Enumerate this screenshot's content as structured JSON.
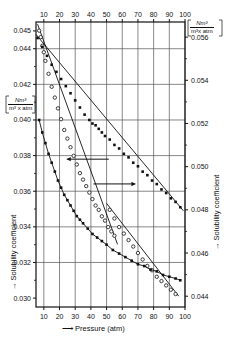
{
  "figure": {
    "background": "#ffffff",
    "axis_color": "#111111",
    "grid_color": "#555555"
  },
  "axes": {
    "bottom": {
      "label": "Pressure (atm)",
      "arrow": "⟶",
      "ticks": [
        "10",
        "20",
        "30",
        "40",
        "50",
        "60",
        "70",
        "80",
        "90",
        "100"
      ],
      "values": [
        10,
        20,
        30,
        40,
        50,
        60,
        70,
        80,
        90,
        100
      ],
      "range": [
        5,
        100
      ]
    },
    "top": {
      "ticks": [
        "10",
        "20",
        "30",
        "40",
        "50",
        "60",
        "70",
        "80",
        "90",
        "100"
      ],
      "values": [
        10,
        20,
        30,
        40,
        50,
        60,
        70,
        80,
        90,
        100
      ],
      "range": [
        5,
        100
      ]
    },
    "left": {
      "title": "Solubility coefficient",
      "arrow": "↑",
      "unit_numerator": "Nm³",
      "unit_denominator": "m³ x atm",
      "ticks": [
        "0.045",
        "0.044",
        "0.042",
        "0.040",
        "0.038",
        "0.036",
        "0.034",
        "0.032",
        "0.030"
      ],
      "values": [
        0.045,
        0.044,
        0.042,
        0.04,
        0.038,
        0.036,
        0.034,
        0.032,
        0.03
      ],
      "range": [
        0.0295,
        0.0455
      ]
    },
    "right": {
      "title": "Solubility coefficient",
      "arrow": "↑",
      "unit_numerator": "Nm³",
      "unit_denominator": "m³x atm",
      "ticks": [
        "0.056",
        "0.054",
        "0.052",
        "0.050",
        "0.048",
        "0.046",
        "0.044"
      ],
      "values": [
        0.056,
        0.054,
        0.052,
        0.05,
        0.048,
        0.046,
        0.044
      ],
      "range": [
        0.0435,
        0.0567
      ]
    }
  },
  "annotations": [
    {
      "name": "arrow-to-right-axis",
      "direction": "right",
      "x_data": 55,
      "y_right": 0.0492
    },
    {
      "name": "arrow-to-left-axis",
      "direction": "left",
      "x_data": 38,
      "y_left": 0.0378
    }
  ],
  "chart_data": {
    "type": "scatter",
    "title": "",
    "xlabel": "Pressure (atm)",
    "ylabel": "Solubility coefficient",
    "xlim": [
      5,
      100
    ],
    "grid": true,
    "legend": "none",
    "series": [
      {
        "name": "upper-curve",
        "axis": "right",
        "marker": "open-circle",
        "ylim": [
          0.0435,
          0.0567
        ],
        "points": [
          [
            7,
            0.0563
          ],
          [
            8,
            0.056
          ],
          [
            9,
            0.0556
          ],
          [
            10,
            0.0553
          ],
          [
            11,
            0.0549
          ],
          [
            13,
            0.0543
          ],
          [
            15,
            0.0537
          ],
          [
            17,
            0.0532
          ],
          [
            19,
            0.0527
          ],
          [
            21,
            0.0522
          ],
          [
            23,
            0.0517
          ],
          [
            25,
            0.0513
          ],
          [
            27,
            0.0509
          ],
          [
            29,
            0.0505
          ],
          [
            31,
            0.0501
          ],
          [
            33,
            0.0497
          ],
          [
            35,
            0.0494
          ],
          [
            37,
            0.0491
          ],
          [
            39,
            0.0488
          ],
          [
            41,
            0.0485
          ],
          [
            43,
            0.0482
          ],
          [
            45,
            0.048
          ],
          [
            47,
            0.0477
          ],
          [
            49,
            0.0475
          ],
          [
            51,
            0.0472
          ],
          [
            53,
            0.047
          ],
          [
            55,
            0.0468
          ]
        ],
        "fit_line": [
          [
            6,
            0.0566
          ],
          [
            57,
            0.0464
          ]
        ]
      },
      {
        "name": "middle-curve",
        "axis": "right",
        "marker": "open-circle",
        "ylim": [
          0.0435,
          0.0567
        ],
        "points": [
          [
            52,
            0.048
          ],
          [
            55,
            0.0476
          ],
          [
            58,
            0.0472
          ],
          [
            61,
            0.0469
          ],
          [
            64,
            0.0466
          ],
          [
            67,
            0.0463
          ],
          [
            70,
            0.046
          ],
          [
            73,
            0.0457
          ],
          [
            76,
            0.0454
          ],
          [
            79,
            0.0452
          ],
          [
            82,
            0.0449
          ],
          [
            85,
            0.0447
          ],
          [
            88,
            0.0445
          ],
          [
            91,
            0.0443
          ],
          [
            94,
            0.0441
          ]
        ],
        "fit_line": [
          [
            50,
            0.0483
          ],
          [
            96,
            0.044
          ]
        ]
      },
      {
        "name": "straight-line-series",
        "axis": "left",
        "marker": "filled-square",
        "ylim": [
          0.0295,
          0.0455
        ],
        "points": [
          [
            6,
            0.0446
          ],
          [
            9,
            0.0441
          ],
          [
            12,
            0.0436
          ],
          [
            15,
            0.0431
          ],
          [
            18,
            0.0427
          ],
          [
            21,
            0.0423
          ],
          [
            24,
            0.0419
          ],
          [
            27,
            0.0415
          ],
          [
            30,
            0.0411
          ],
          [
            33,
            0.0407
          ],
          [
            36,
            0.0403
          ],
          [
            39,
            0.04
          ],
          [
            41,
            0.0398
          ],
          [
            43,
            0.0397
          ],
          [
            45,
            0.0395
          ],
          [
            47,
            0.0393
          ],
          [
            49,
            0.0391
          ],
          [
            52,
            0.0389
          ],
          [
            55,
            0.0386
          ],
          [
            58,
            0.0384
          ],
          [
            61,
            0.0381
          ],
          [
            64,
            0.0379
          ],
          [
            67,
            0.0376
          ],
          [
            70,
            0.0374
          ],
          [
            73,
            0.0371
          ],
          [
            76,
            0.0369
          ],
          [
            79,
            0.0366
          ],
          [
            82,
            0.0364
          ],
          [
            85,
            0.0361
          ],
          [
            88,
            0.0359
          ],
          [
            91,
            0.0356
          ],
          [
            94,
            0.0354
          ],
          [
            97,
            0.0351
          ]
        ],
        "fit_line": [
          [
            5,
            0.0448
          ],
          [
            99,
            0.0349
          ]
        ]
      },
      {
        "name": "lower-decay-curve",
        "axis": "left",
        "marker": "filled-square",
        "ylim": [
          0.0295,
          0.0455
        ],
        "points": [
          [
            7,
            0.04
          ],
          [
            9,
            0.0393
          ],
          [
            11,
            0.0387
          ],
          [
            13,
            0.0381
          ],
          [
            15,
            0.0376
          ],
          [
            17,
            0.0371
          ],
          [
            19,
            0.0366
          ],
          [
            21,
            0.0362
          ],
          [
            23,
            0.0358
          ],
          [
            25,
            0.0355
          ],
          [
            27,
            0.0352
          ],
          [
            29,
            0.0349
          ],
          [
            31,
            0.0346
          ],
          [
            33,
            0.0344
          ],
          [
            35,
            0.0342
          ],
          [
            38,
            0.0339
          ],
          [
            41,
            0.0336
          ],
          [
            44,
            0.0334
          ],
          [
            47,
            0.0332
          ],
          [
            50,
            0.033
          ],
          [
            54,
            0.0327
          ],
          [
            58,
            0.0325
          ],
          [
            62,
            0.0323
          ],
          [
            66,
            0.0321
          ],
          [
            70,
            0.0319
          ],
          [
            74,
            0.0318
          ],
          [
            78,
            0.0316
          ],
          [
            82,
            0.0315
          ],
          [
            86,
            0.0313
          ],
          [
            90,
            0.0312
          ],
          [
            94,
            0.0311
          ],
          [
            97,
            0.031
          ]
        ],
        "fit_line": null
      }
    ]
  }
}
